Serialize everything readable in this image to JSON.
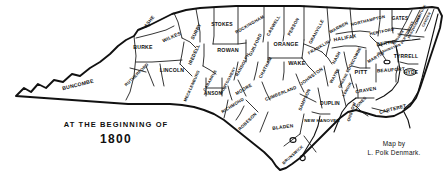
{
  "figure": {
    "kind": "historical-county-map",
    "region": "North Carolina",
    "title_line1": "AT THE BEGINNING OF",
    "title_line2": "1800",
    "credit_line1": "Map by",
    "credit_line2": "L. Polk Denmark.",
    "ink_color": "#111111",
    "paper_color": "#ffffff"
  },
  "counties": [
    {
      "name": "BUNCOMBE",
      "x": 78,
      "y": 85,
      "rot": -14,
      "size": 5.2
    },
    {
      "name": "BURKE",
      "x": 143,
      "y": 48,
      "rot": 0,
      "size": 5.2
    },
    {
      "name": "ASHE",
      "x": 150,
      "y": 22,
      "rot": -52,
      "size": 4.6
    },
    {
      "name": "WILKES",
      "x": 172,
      "y": 38,
      "rot": -24,
      "size": 4.8
    },
    {
      "name": "SURRY",
      "x": 197,
      "y": 32,
      "rot": -62,
      "size": 4.8
    },
    {
      "name": "STOKES",
      "x": 222,
      "y": 24,
      "rot": 0,
      "size": 5.0
    },
    {
      "name": "ROCKINGHAM",
      "x": 250,
      "y": 25,
      "rot": -30,
      "size": 4.4
    },
    {
      "name": "CASWELL",
      "x": 274,
      "y": 26,
      "rot": -60,
      "size": 4.4
    },
    {
      "name": "PERSON",
      "x": 294,
      "y": 27,
      "rot": -62,
      "size": 4.4
    },
    {
      "name": "GRANVILLE",
      "x": 317,
      "y": 32,
      "rot": -62,
      "size": 4.4
    },
    {
      "name": "WARREN",
      "x": 339,
      "y": 28,
      "rot": -28,
      "size": 4.4
    },
    {
      "name": "NORTHAMPTON",
      "x": 368,
      "y": 21,
      "rot": -14,
      "size": 4.2
    },
    {
      "name": "GATES",
      "x": 400,
      "y": 19,
      "rot": 0,
      "size": 4.6
    },
    {
      "name": "CURRITUCK",
      "x": 421,
      "y": 15,
      "rot": -64,
      "size": 3.4
    },
    {
      "name": "CAMDEN",
      "x": 427,
      "y": 20,
      "rot": -64,
      "size": 3.4
    },
    {
      "name": "PASQUOTANK",
      "x": 415,
      "y": 27,
      "rot": -64,
      "size": 3.4
    },
    {
      "name": "PERQUIMANS",
      "x": 408,
      "y": 33,
      "rot": -64,
      "size": 3.4
    },
    {
      "name": "CHOWAN",
      "x": 399,
      "y": 38,
      "rot": -56,
      "size": 3.4
    },
    {
      "name": "HERTFORD",
      "x": 382,
      "y": 32,
      "rot": -12,
      "size": 4.2
    },
    {
      "name": "BERTIE",
      "x": 386,
      "y": 44,
      "rot": -8,
      "size": 4.8
    },
    {
      "name": "HALIFAX",
      "x": 345,
      "y": 38,
      "rot": -10,
      "size": 5.0
    },
    {
      "name": "IREDELL",
      "x": 195,
      "y": 55,
      "rot": -66,
      "size": 4.8
    },
    {
      "name": "ROWAN",
      "x": 228,
      "y": 51,
      "rot": 0,
      "size": 5.4
    },
    {
      "name": "GUILFORD",
      "x": 256,
      "y": 45,
      "rot": -64,
      "size": 4.4
    },
    {
      "name": "ORANGE",
      "x": 286,
      "y": 45,
      "rot": 0,
      "size": 5.4
    },
    {
      "name": "FRANKLIN",
      "x": 319,
      "y": 48,
      "rot": -30,
      "size": 4.4
    },
    {
      "name": "NASH",
      "x": 337,
      "y": 58,
      "rot": -62,
      "size": 4.4
    },
    {
      "name": "EDGECOMBE",
      "x": 354,
      "y": 60,
      "rot": -62,
      "size": 4.0
    },
    {
      "name": "MARTIN",
      "x": 376,
      "y": 58,
      "rot": -30,
      "size": 4.4
    },
    {
      "name": "TYRRELL",
      "x": 406,
      "y": 56,
      "rot": 0,
      "size": 5.0
    },
    {
      "name": "WASHINGTON",
      "x": 389,
      "y": 50,
      "rot": -22,
      "size": 3.4
    },
    {
      "name": "LINCOLN",
      "x": 172,
      "y": 71,
      "rot": 0,
      "size": 5.2
    },
    {
      "name": "RUTHERFORD",
      "x": 137,
      "y": 75,
      "rot": -44,
      "size": 4.2
    },
    {
      "name": "MECKLENBURG",
      "x": 192,
      "y": 86,
      "rot": -66,
      "size": 4.0
    },
    {
      "name": "CABARRUS",
      "x": 211,
      "y": 81,
      "rot": -60,
      "size": 3.8
    },
    {
      "name": "MONTGOMERY",
      "x": 229,
      "y": 81,
      "rot": -62,
      "size": 3.8
    },
    {
      "name": "RANDOLPH",
      "x": 243,
      "y": 65,
      "rot": -62,
      "size": 4.2
    },
    {
      "name": "CHATHAM",
      "x": 266,
      "y": 68,
      "rot": -62,
      "size": 4.4
    },
    {
      "name": "WAKE",
      "x": 297,
      "y": 64,
      "rot": 0,
      "size": 5.6
    },
    {
      "name": "JOHNSTON",
      "x": 312,
      "y": 77,
      "rot": -36,
      "size": 4.6
    },
    {
      "name": "WAYNE",
      "x": 335,
      "y": 76,
      "rot": -62,
      "size": 4.2
    },
    {
      "name": "GREENE",
      "x": 344,
      "y": 81,
      "rot": -62,
      "size": 3.6
    },
    {
      "name": "PITT",
      "x": 361,
      "y": 73,
      "rot": 0,
      "size": 5.6
    },
    {
      "name": "BEAUFORT",
      "x": 391,
      "y": 71,
      "rot": -4,
      "size": 4.8
    },
    {
      "name": "HYDE",
      "x": 411,
      "y": 73,
      "rot": 0,
      "size": 4.8
    },
    {
      "name": "ANSON",
      "x": 213,
      "y": 94,
      "rot": 0,
      "size": 4.8
    },
    {
      "name": "MOORE",
      "x": 244,
      "y": 90,
      "rot": -30,
      "size": 4.6
    },
    {
      "name": "CUMBERLAND",
      "x": 281,
      "y": 94,
      "rot": -22,
      "size": 4.4
    },
    {
      "name": "SAMPSON",
      "x": 305,
      "y": 100,
      "rot": -66,
      "size": 4.4
    },
    {
      "name": "DUPLIN",
      "x": 330,
      "y": 103,
      "rot": 0,
      "size": 5.0
    },
    {
      "name": "LENOIR",
      "x": 348,
      "y": 90,
      "rot": -60,
      "size": 3.8
    },
    {
      "name": "CRAVEN",
      "x": 366,
      "y": 91,
      "rot": -10,
      "size": 4.8
    },
    {
      "name": "JONES",
      "x": 361,
      "y": 103,
      "rot": -48,
      "size": 4.2
    },
    {
      "name": "ONSLOW",
      "x": 352,
      "y": 112,
      "rot": -72,
      "size": 4.2
    },
    {
      "name": "CARTERET",
      "x": 393,
      "y": 110,
      "rot": -14,
      "size": 4.8
    },
    {
      "name": "RICHMOND",
      "x": 233,
      "y": 106,
      "rot": -32,
      "size": 4.4
    },
    {
      "name": "ROBESON",
      "x": 248,
      "y": 122,
      "rot": -44,
      "size": 4.4
    },
    {
      "name": "BLADEN",
      "x": 283,
      "y": 128,
      "rot": -8,
      "size": 4.8
    },
    {
      "name": "NEW HANOVER",
      "x": 322,
      "y": 121,
      "rot": 0,
      "size": 4.4
    },
    {
      "name": "BRUNSWICK",
      "x": 293,
      "y": 155,
      "rot": -42,
      "size": 4.0
    }
  ]
}
